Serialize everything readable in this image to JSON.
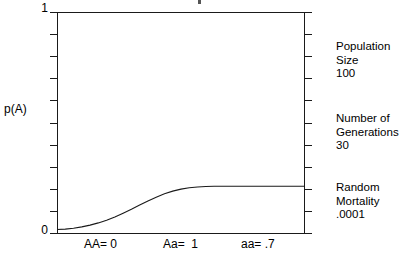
{
  "figure": {
    "y_axis_title": "p(A)",
    "y_max_label": "1",
    "y_min_label": "0",
    "x_tick_labels": [
      "AA= 0",
      "Aa=  1",
      "aa= .7"
    ],
    "parameters": [
      {
        "line1": "Population",
        "line2": "Size",
        "line3": "100"
      },
      {
        "line1": "Number of",
        "line2": "Generations",
        "line3": "30"
      },
      {
        "line1": "Random",
        "line2": "Mortality",
        "line3": ".0001"
      }
    ]
  },
  "chart_data": {
    "type": "line",
    "title": "",
    "xlabel": "",
    "ylabel": "p(A)",
    "ylim": [
      0,
      1
    ],
    "xlim": [
      0,
      30
    ],
    "grid": false,
    "legend": null,
    "y_tick_labels": [
      "0",
      "1"
    ],
    "y_tick_count": 11,
    "x_annotations": [
      "AA= 0",
      "Aa=  1",
      "aa= .7"
    ],
    "series": [
      {
        "name": "p(A)",
        "x": [
          0,
          1,
          2,
          3,
          4,
          5,
          6,
          7,
          8,
          9,
          10,
          11,
          12,
          13,
          14,
          15,
          16,
          17,
          18,
          19,
          20,
          21,
          22,
          23,
          24,
          25,
          26,
          27,
          28,
          29,
          30
        ],
        "values": [
          0.02,
          0.022,
          0.026,
          0.032,
          0.04,
          0.05,
          0.062,
          0.077,
          0.094,
          0.112,
          0.131,
          0.149,
          0.166,
          0.181,
          0.193,
          0.202,
          0.208,
          0.212,
          0.214,
          0.215,
          0.215,
          0.215,
          0.215,
          0.215,
          0.215,
          0.215,
          0.215,
          0.215,
          0.215,
          0.215,
          0.215
        ]
      }
    ],
    "annotations": [
      "Population Size 100",
      "Number of Generations 30",
      "Random Mortality .0001"
    ]
  }
}
